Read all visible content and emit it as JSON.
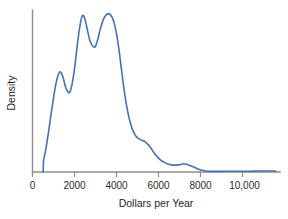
{
  "chart_data": {
    "type": "line",
    "title": "",
    "subtitle": "",
    "xlabel": "Dollars per Year",
    "ylabel": "Density",
    "xlim": [
      0,
      11500
    ],
    "ylim": [
      0,
      1
    ],
    "grid": false,
    "legend": null,
    "xticks": [
      0,
      2000,
      4000,
      6000,
      8000,
      10000
    ],
    "xtick_labels": [
      "0",
      "2000",
      "4000",
      "6000",
      "8000",
      "10,000"
    ],
    "yticks": [],
    "ytick_labels": [],
    "curve_color": "#4472b8",
    "axis_color": "#8d8d8d",
    "series": [
      {
        "name": "Density",
        "x": [
          500,
          520,
          560,
          640,
          760,
          900,
          1050,
          1180,
          1300,
          1420,
          1560,
          1680,
          1760,
          1850,
          1980,
          2100,
          2200,
          2280,
          2350,
          2450,
          2560,
          2680,
          2800,
          2900,
          2950,
          3050,
          3180,
          3320,
          3460,
          3600,
          3720,
          3840,
          3960,
          4080,
          4200,
          4330,
          4460,
          4600,
          4720,
          4850,
          4980,
          5120,
          5280,
          5420,
          5560,
          5700,
          5850,
          6000,
          6160,
          6320,
          6500,
          6680,
          6850,
          7000,
          7150,
          7320,
          7500,
          7700,
          7900,
          8100,
          8400,
          8800,
          9200,
          9700,
          10200,
          10700,
          11100,
          11400
        ],
        "y": [
          0.0,
          0.075,
          0.1,
          0.155,
          0.26,
          0.39,
          0.52,
          0.6,
          0.63,
          0.6,
          0.53,
          0.5,
          0.505,
          0.55,
          0.66,
          0.8,
          0.9,
          0.96,
          0.985,
          0.965,
          0.9,
          0.83,
          0.795,
          0.785,
          0.79,
          0.83,
          0.9,
          0.96,
          0.99,
          0.995,
          0.975,
          0.93,
          0.85,
          0.74,
          0.61,
          0.48,
          0.38,
          0.3,
          0.255,
          0.225,
          0.21,
          0.2,
          0.19,
          0.172,
          0.148,
          0.12,
          0.095,
          0.075,
          0.062,
          0.052,
          0.045,
          0.043,
          0.045,
          0.05,
          0.05,
          0.044,
          0.034,
          0.022,
          0.012,
          0.006,
          0.004,
          0.004,
          0.005,
          0.005,
          0.005,
          0.006,
          0.006,
          0.006
        ],
        "modes": [
          {
            "x": 1300,
            "label": "first mode"
          },
          {
            "x": 2350,
            "label": "second mode"
          },
          {
            "x": 3600,
            "label": "third mode"
          },
          {
            "x": 7000,
            "label": "minor tail bump"
          }
        ]
      }
    ]
  },
  "axis": {
    "x_title": "Dollars per Year",
    "y_title": "Density"
  }
}
